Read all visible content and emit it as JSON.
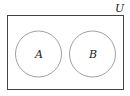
{
  "diagram": {
    "type": "venn",
    "universe_label": "U",
    "sets": [
      {
        "label": "A"
      },
      {
        "label": "B"
      }
    ],
    "overlap": false
  },
  "colors": {
    "universe_stroke": "#444444",
    "circle_stroke": "#888888",
    "text": "#222222"
  }
}
